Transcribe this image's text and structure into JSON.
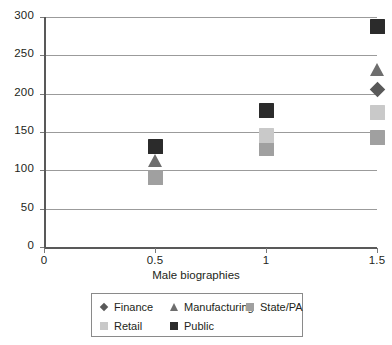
{
  "chart_data": {
    "type": "scatter",
    "title": "",
    "xlabel": "Male biographies",
    "ylabel": "",
    "xlim": [
      0,
      1.5
    ],
    "ylim": [
      0,
      300
    ],
    "grid": true,
    "legend_position": "bottom",
    "x_ticks": [
      "0",
      "0.5",
      "1",
      "1.5"
    ],
    "x_tick_values": [
      0,
      0.5,
      1,
      1.5
    ],
    "y_ticks": [
      "0",
      "50",
      "100",
      "150",
      "200",
      "250",
      "300"
    ],
    "y_tick_values": [
      0,
      50,
      100,
      150,
      200,
      250,
      300
    ],
    "series": [
      {
        "name": "Finance",
        "marker": "diamond",
        "color": "#595959",
        "points": [
          {
            "x": 1.5,
            "y": 205
          }
        ]
      },
      {
        "name": "Manufacturing",
        "marker": "triangle",
        "color": "#6e6e6e",
        "points": [
          {
            "x": 0.5,
            "y": 113
          },
          {
            "x": 1.5,
            "y": 231
          }
        ]
      },
      {
        "name": "State/PA",
        "marker": "square",
        "color": "#a0a0a0",
        "points": [
          {
            "x": 0.5,
            "y": 91
          },
          {
            "x": 1.0,
            "y": 128
          },
          {
            "x": 1.5,
            "y": 143
          }
        ]
      },
      {
        "name": "Retail",
        "marker": "square",
        "color": "#c9c9c9",
        "points": [
          {
            "x": 1.0,
            "y": 146
          },
          {
            "x": 1.5,
            "y": 176
          }
        ]
      },
      {
        "name": "Public",
        "marker": "square",
        "color": "#2b2b2b",
        "points": [
          {
            "x": 0.5,
            "y": 131
          },
          {
            "x": 1.0,
            "y": 178
          },
          {
            "x": 1.5,
            "y": 287
          }
        ]
      }
    ],
    "legend_entries": [
      {
        "label": "Finance",
        "marker": "diamond",
        "color": "#595959"
      },
      {
        "label": "Manufacturing",
        "marker": "triangle",
        "color": "#6e6e6e"
      },
      {
        "label": "State/PA",
        "marker": "square",
        "color": "#a0a0a0"
      },
      {
        "label": "Retail",
        "marker": "square",
        "color": "#c9c9c9"
      },
      {
        "label": "Public",
        "marker": "square",
        "color": "#2b2b2b"
      }
    ]
  },
  "axes": {
    "x_title": "Male biographies"
  },
  "colors": {
    "gridline": "#9b9b9b",
    "axis": "#595959",
    "text": "#231f20",
    "background": "#ffffff",
    "legend_border": "#8a8a8a"
  }
}
